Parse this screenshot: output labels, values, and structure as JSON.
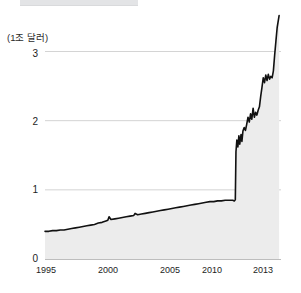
{
  "figure": {
    "unit_label": "(1조 달러)",
    "background_color": "#ffffff",
    "top_band_color": "#e3e4e6"
  },
  "chart_data": {
    "type": "area",
    "title": "",
    "subtitle": "",
    "xlabel": "",
    "ylabel": "(1조 달러)",
    "unit_note": "(1조 달러)",
    "grid": true,
    "grid_lines_at": [
      1,
      2,
      3
    ],
    "legend": null,
    "legend_position": "none",
    "line_color": "#111111",
    "fill_color": "#ececec",
    "xlim": [
      1995,
      2013.6
    ],
    "ylim": [
      0,
      3.6
    ],
    "x_ticks": [
      "1995",
      "2000",
      "2005",
      "2010",
      "2013"
    ],
    "x_tick_values": [
      1995,
      2000,
      2005,
      2010,
      2013
    ],
    "y_ticks": [
      "0",
      "1",
      "2",
      "3"
    ],
    "y_tick_values": [
      0,
      1,
      2,
      3
    ],
    "x": [
      1995.0,
      1995.3,
      1995.6,
      1995.9,
      1996.2,
      1996.5,
      1996.8,
      1997.1,
      1997.4,
      1997.7,
      1998.0,
      1998.3,
      1998.6,
      1998.9,
      1999.2,
      1999.5,
      1999.8,
      1999.95,
      2000.05,
      2000.2,
      2000.5,
      2000.8,
      2001.1,
      2001.4,
      2001.7,
      2002.0,
      2002.1,
      2002.3,
      2002.6,
      2002.9,
      2003.2,
      2003.5,
      2003.8,
      2004.1,
      2004.4,
      2004.7,
      2005.0,
      2005.3,
      2005.6,
      2005.9,
      2006.2,
      2006.5,
      2006.8,
      2007.1,
      2007.4,
      2007.7,
      2008.0,
      2008.3,
      2008.6,
      2008.9,
      2009.2,
      2009.5,
      2009.8,
      2009.92,
      2009.97,
      2010.0,
      2010.05,
      2010.12,
      2010.2,
      2010.28,
      2010.35,
      2010.45,
      2010.52,
      2010.6,
      2010.7,
      2010.8,
      2010.9,
      2011.0,
      2011.1,
      2011.2,
      2011.3,
      2011.4,
      2011.5,
      2011.6,
      2011.7,
      2011.8,
      2011.9,
      2012.0,
      2012.1,
      2012.2,
      2012.3,
      2012.4,
      2012.5,
      2012.6,
      2012.7,
      2012.8,
      2012.9,
      2013.0,
      2013.1,
      2013.2,
      2013.3,
      2013.45
    ],
    "values": [
      0.4,
      0.4,
      0.41,
      0.41,
      0.42,
      0.42,
      0.43,
      0.44,
      0.45,
      0.46,
      0.47,
      0.48,
      0.49,
      0.5,
      0.52,
      0.53,
      0.55,
      0.56,
      0.61,
      0.57,
      0.58,
      0.59,
      0.6,
      0.61,
      0.62,
      0.63,
      0.66,
      0.64,
      0.65,
      0.66,
      0.67,
      0.68,
      0.69,
      0.7,
      0.71,
      0.72,
      0.73,
      0.74,
      0.75,
      0.76,
      0.77,
      0.78,
      0.79,
      0.8,
      0.81,
      0.82,
      0.83,
      0.83,
      0.84,
      0.84,
      0.85,
      0.85,
      0.85,
      0.84,
      0.85,
      0.86,
      1.55,
      1.72,
      1.62,
      1.78,
      1.66,
      1.8,
      1.7,
      1.85,
      1.9,
      1.86,
      1.95,
      2.05,
      1.98,
      2.1,
      2.02,
      2.18,
      2.05,
      2.12,
      2.08,
      2.15,
      2.2,
      2.35,
      2.48,
      2.62,
      2.55,
      2.66,
      2.58,
      2.67,
      2.6,
      2.64,
      2.62,
      2.72,
      2.95,
      3.15,
      3.35,
      3.52
    ]
  },
  "axes": {
    "y_axis_name": "y-axis",
    "x_axis_name": "x-axis"
  }
}
